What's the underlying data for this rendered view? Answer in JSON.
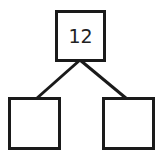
{
  "diagram": {
    "type": "number-bond",
    "whole": {
      "value": "12"
    },
    "parts": [
      {
        "value": ""
      },
      {
        "value": ""
      }
    ],
    "colors": {
      "stroke": "#1a1a1a",
      "background": "#ffffff"
    }
  }
}
